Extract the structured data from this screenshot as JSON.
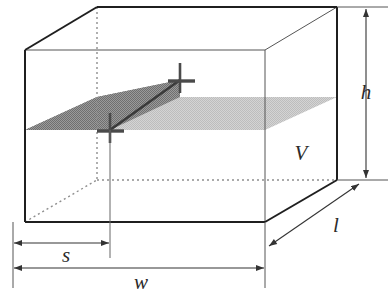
{
  "figure": {
    "type": "3d-box-diagram",
    "background": "#ffffff",
    "line_color": "#262626",
    "thin_line_color": "#555555",
    "water_dark_color": "#8a8a8a",
    "water_light_color": "#c9c9c9",
    "marker_color": "#4a4a4a"
  },
  "labels": {
    "height": "h",
    "length": "l",
    "width": "w",
    "segment": "s",
    "volume": "V"
  },
  "geometry": {
    "front_face": {
      "tl": [
        25,
        50
      ],
      "tr": [
        265,
        50
      ],
      "br": [
        265,
        222
      ],
      "bl": [
        25,
        222
      ]
    },
    "back_offset": [
      72,
      -43
    ],
    "water_front_y": 130,
    "water_back_y": 97,
    "markers": [
      [
        110,
        130
      ],
      [
        180,
        80
      ]
    ]
  },
  "dimensions": {
    "s_line_y": 243,
    "s_from_x": 13,
    "s_to_x": 110,
    "w_line_y": 268,
    "w_from_x": 13,
    "w_to_x": 265,
    "h_line_x": 366,
    "h_from_y": 10,
    "h_to_y": 180,
    "l_from": [
      268,
      246
    ],
    "l_to": [
      360,
      184
    ]
  }
}
